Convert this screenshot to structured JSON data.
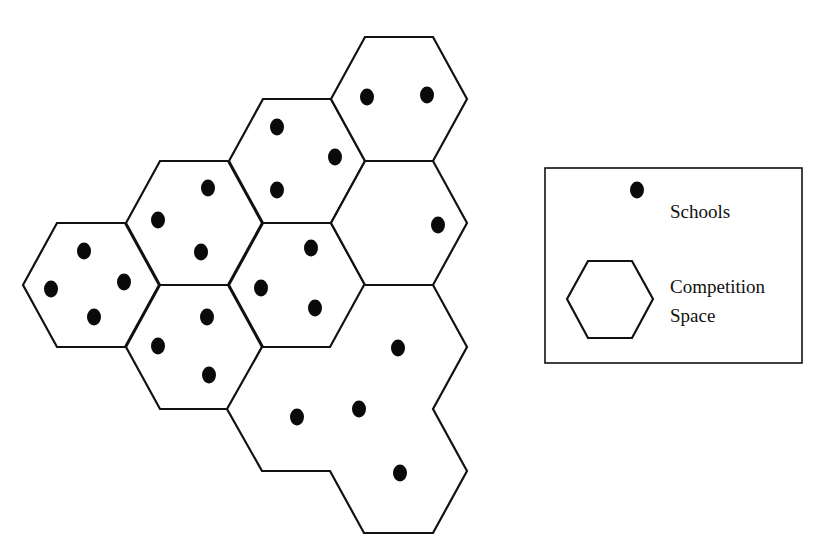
{
  "diagram": {
    "title": "",
    "stroke_color": "#111111",
    "dot_color": "#0a0a0a",
    "hex_geometry": {
      "half_width": 68,
      "half_edge": 34,
      "half_height": 62
    },
    "competition_spaces": [
      {
        "id": "hex-a",
        "center": [
          91,
          285
        ],
        "schools": [
          [
            84,
            251
          ],
          [
            51,
            289
          ],
          [
            124,
            282
          ],
          [
            94,
            317
          ]
        ]
      },
      {
        "id": "hex-b",
        "center": [
          194,
          223
        ],
        "schools": [
          [
            208,
            188
          ],
          [
            158,
            220
          ],
          [
            201,
            252
          ]
        ]
      },
      {
        "id": "hex-c",
        "center": [
          194,
          347
        ],
        "schools": [
          [
            207,
            317
          ],
          [
            158,
            346
          ],
          [
            209,
            375
          ]
        ]
      },
      {
        "id": "hex-d",
        "center": [
          297,
          161
        ],
        "schools": [
          [
            277,
            127
          ],
          [
            335,
            157
          ],
          [
            277,
            190
          ]
        ]
      },
      {
        "id": "hex-e",
        "center": [
          297,
          285
        ],
        "schools": [
          [
            311,
            248
          ],
          [
            261,
            288
          ],
          [
            315,
            308
          ]
        ]
      },
      {
        "id": "hex-f",
        "center": [
          399,
          99
        ],
        "schools": [
          [
            367,
            97
          ],
          [
            427,
            95
          ]
        ]
      },
      {
        "id": "hex-g",
        "center": [
          399,
          223
        ],
        "schools": [
          [
            438,
            225
          ]
        ]
      }
    ],
    "merged_space": {
      "id": "merged-space",
      "outline": [
        [
          262,
          347
        ],
        [
          330,
          347
        ],
        [
          364,
          285
        ],
        [
          433,
          285
        ],
        [
          467,
          347
        ],
        [
          433,
          409
        ],
        [
          467,
          471
        ],
        [
          433,
          533
        ],
        [
          364,
          533
        ],
        [
          330,
          471
        ],
        [
          262,
          471
        ],
        [
          227,
          409
        ]
      ],
      "schools": [
        [
          398,
          348
        ],
        [
          297,
          417
        ],
        [
          359,
          409
        ],
        [
          400,
          473
        ]
      ]
    }
  },
  "legend": {
    "box": [
      545,
      168,
      257,
      195
    ],
    "schools_label": "Schools",
    "competition_label_line1": "Competition",
    "competition_label_line2": "Space",
    "dot": [
      637,
      190
    ],
    "hex": [
      [
        567,
        299
      ],
      [
        588,
        261
      ],
      [
        632,
        261
      ],
      [
        653,
        299
      ],
      [
        632,
        338
      ],
      [
        588,
        338
      ]
    ]
  }
}
